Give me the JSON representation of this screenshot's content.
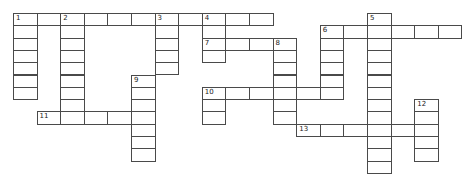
{
  "puzzle": {
    "origin": [
      13,
      13
    ],
    "cell_w": 23.6,
    "cell_h": 12.3,
    "entries": [
      {
        "number": "1",
        "dir": "across",
        "row": 0,
        "col": 0,
        "len": 11
      },
      {
        "number": "1",
        "dir": "down",
        "row": 0,
        "col": 0,
        "len": 7
      },
      {
        "number": "2",
        "dir": "down",
        "row": 0,
        "col": 2,
        "len": 9
      },
      {
        "number": "3",
        "dir": "down",
        "row": 0,
        "col": 6,
        "len": 5
      },
      {
        "number": "4",
        "dir": "down",
        "row": 0,
        "col": 8,
        "len": 4
      },
      {
        "number": "5",
        "dir": "down",
        "row": 0,
        "col": 15,
        "len": 13
      },
      {
        "number": "6",
        "dir": "across",
        "row": 1,
        "col": 13,
        "len": 6
      },
      {
        "number": "6",
        "dir": "down",
        "row": 1,
        "col": 13,
        "len": 6
      },
      {
        "number": "7",
        "dir": "across",
        "row": 2,
        "col": 8,
        "len": 4
      },
      {
        "number": "8",
        "dir": "down",
        "row": 2,
        "col": 11,
        "len": 7
      },
      {
        "number": "9",
        "dir": "down",
        "row": 5,
        "col": 5,
        "len": 7
      },
      {
        "number": "10",
        "dir": "across",
        "row": 6,
        "col": 8,
        "len": 6
      },
      {
        "number": "10",
        "dir": "down",
        "row": 6,
        "col": 8,
        "len": 3
      },
      {
        "number": "11",
        "dir": "across",
        "row": 8,
        "col": 1,
        "len": 5
      },
      {
        "number": "12",
        "dir": "down",
        "row": 7,
        "col": 17,
        "len": 5
      },
      {
        "number": "13",
        "dir": "across",
        "row": 9,
        "col": 12,
        "len": 6
      }
    ],
    "labels": [
      {
        "number": "1",
        "row": 0,
        "col": 0
      },
      {
        "number": "2",
        "row": 0,
        "col": 2
      },
      {
        "number": "3",
        "row": 0,
        "col": 6
      },
      {
        "number": "4",
        "row": 0,
        "col": 8
      },
      {
        "number": "5",
        "row": 0,
        "col": 15
      },
      {
        "number": "6",
        "row": 1,
        "col": 13
      },
      {
        "number": "7",
        "row": 2,
        "col": 8
      },
      {
        "number": "8",
        "row": 2,
        "col": 11
      },
      {
        "number": "9",
        "row": 5,
        "col": 5
      },
      {
        "number": "10",
        "row": 6,
        "col": 8
      },
      {
        "number": "11",
        "row": 8,
        "col": 1
      },
      {
        "number": "12",
        "row": 7,
        "col": 17
      },
      {
        "number": "13",
        "row": 9,
        "col": 12
      }
    ]
  },
  "colors": {
    "line": "#4a4a4a",
    "background": "#ffffff",
    "number": "#222222"
  }
}
